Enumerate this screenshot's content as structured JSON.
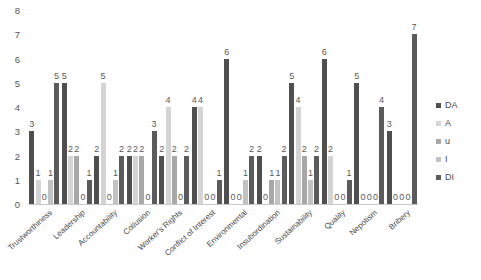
{
  "chart_data": {
    "type": "bar",
    "title": "",
    "xlabel": "",
    "ylabel": "",
    "ylim": [
      0,
      8
    ],
    "yticks": [
      "0",
      "1",
      "2",
      "3",
      "4",
      "5",
      "6",
      "7",
      "8"
    ],
    "grid": false,
    "legend_position": "right",
    "categories": [
      "Trustworthiness",
      "Leadership",
      "Accountability",
      "Collusion",
      "Worker's Rights",
      "Conflict of Interest",
      "Environmental",
      "Insubordination",
      "Sustainability",
      "Quality",
      "Nepotism",
      "Bribery"
    ],
    "series": [
      {
        "name": "DA",
        "color": "#4f4f4f",
        "values": [
          3,
          5,
          2,
          2,
          2,
          4,
          6,
          2,
          5,
          6,
          5,
          3
        ]
      },
      {
        "name": "A",
        "color": "#d4d4d4",
        "values": [
          1,
          2,
          5,
          2,
          4,
          4,
          0,
          0,
          4,
          2,
          0,
          0
        ]
      },
      {
        "name": "u",
        "color": "#a8a8a8",
        "values": [
          0,
          2,
          0,
          2,
          2,
          0,
          0,
          1,
          2,
          0,
          0,
          0
        ]
      },
      {
        "name": "I",
        "color": "#c2c2c2",
        "values": [
          1,
          0,
          1,
          0,
          0,
          0,
          1,
          1,
          1,
          0,
          0,
          0
        ]
      },
      {
        "name": "DI",
        "color": "#5b5b5b",
        "values": [
          5,
          1,
          2,
          3,
          2,
          1,
          2,
          2,
          2,
          1,
          4,
          7
        ]
      }
    ]
  },
  "legend": {
    "items": [
      {
        "label": "DA"
      },
      {
        "label": "A"
      },
      {
        "label": "u"
      },
      {
        "label": "I"
      },
      {
        "label": "DI"
      }
    ]
  }
}
